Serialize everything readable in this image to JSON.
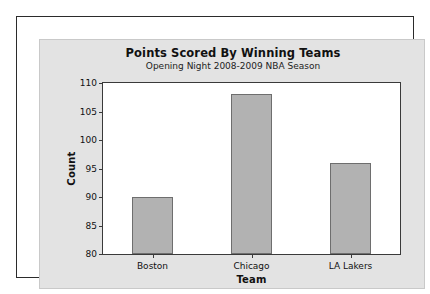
{
  "chart_data": {
    "type": "bar",
    "title": "Points Scored By Winning Teams",
    "subtitle": "Opening Night 2008-2009 NBA Season",
    "xlabel": "Team",
    "ylabel": "Count",
    "categories": [
      "Boston",
      "Chicago",
      "LA Lakers"
    ],
    "values": [
      90,
      108,
      96
    ],
    "ylim": [
      80,
      110
    ],
    "yticks": [
      80,
      85,
      90,
      95,
      100,
      105,
      110
    ],
    "ytick_labels": [
      "80",
      "85",
      "90",
      "95",
      "100",
      "105",
      "110"
    ],
    "grid": false,
    "legend": null,
    "bar_color": "#b2b2b2",
    "bar_edge_color": "#6e6e6e",
    "plot_background": "#ffffff",
    "panel_background": "#e3e3e3",
    "frame_color": "#2b2b2b",
    "text_color": "#111111"
  }
}
